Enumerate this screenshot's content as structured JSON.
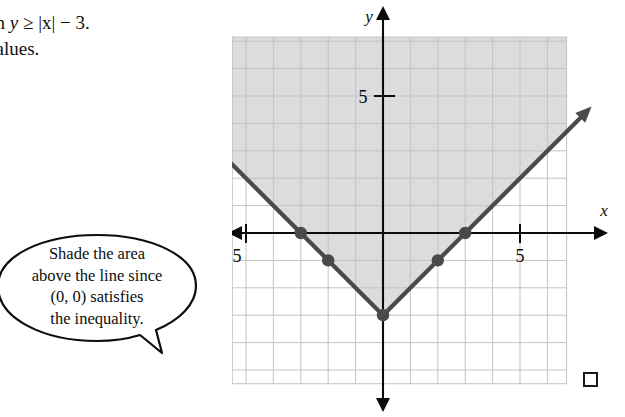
{
  "problem": {
    "line1_prefix": "ph ",
    "line1_var": "y",
    "line1_rel": " ≥ ",
    "line1_abs": "|x|",
    "line1_suffix": " − 3.",
    "line2": "values."
  },
  "callout": {
    "line1": "Shade the area",
    "line2": "above the line since",
    "line3": "(0, 0) satisfies",
    "line4": "the inequality."
  },
  "chart_data": {
    "type": "line",
    "title": "",
    "function": "y = |x| - 3",
    "inequality": "y ≥ |x| − 3",
    "xlabel": "x",
    "ylabel": "y",
    "xlim": [
      -7.5,
      7.5
    ],
    "ylim": [
      -5.5,
      7.5
    ],
    "grid": true,
    "grid_step": 1,
    "x_ticks": [
      -5,
      5
    ],
    "y_ticks": [
      5
    ],
    "x_tick_labels": [
      "−5",
      "5"
    ],
    "y_tick_labels": [
      "5"
    ],
    "series": [
      {
        "name": "y = |x| - 3",
        "style": "solid",
        "arrows": "both",
        "x": [
          -7.2,
          0,
          7.2
        ],
        "y": [
          4.2,
          -3,
          4.2
        ]
      }
    ],
    "points": [
      {
        "x": -3,
        "y": 0
      },
      {
        "x": -2,
        "y": -1
      },
      {
        "x": 0,
        "y": -3
      },
      {
        "x": 2,
        "y": -1
      },
      {
        "x": 3,
        "y": 0
      }
    ],
    "shaded_region": {
      "description": "region above and on the line y = |x| - 3",
      "color": "#dcdcdc",
      "test_point": "(0, 0)"
    },
    "colors": {
      "grid": "#c3c3c3",
      "axis": "#0b0b0b",
      "line": "#4a4a4a",
      "shade": "#dcdcdc"
    }
  },
  "corner": {
    "checkbox_label": ""
  }
}
